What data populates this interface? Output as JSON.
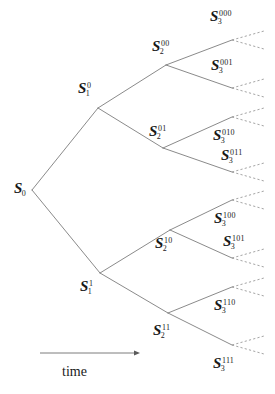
{
  "figure": {
    "type": "scenario-tree",
    "background_color": "#ffffff",
    "line_color": "#7d7d7d",
    "dash_color": "#9a9a9a",
    "text_color": "#1a1a1a"
  },
  "axis": {
    "caption": "time",
    "arrow_from_x": 40,
    "arrow_to_x": 140,
    "arrow_y": 353,
    "caption_x": 62,
    "caption_y": 365
  },
  "nodes": [
    {
      "id": "S0",
      "base": "S",
      "sub": "0",
      "sup": "",
      "x": 32,
      "y": 190,
      "label_x": 14,
      "label_y": 181,
      "stage": 0
    },
    {
      "id": "S1_0",
      "base": "S",
      "sub": "1",
      "sup": "0",
      "x": 98,
      "y": 108,
      "label_x": 78,
      "label_y": 81,
      "stage": 1
    },
    {
      "id": "S1_1",
      "base": "S",
      "sub": "1",
      "sup": "1",
      "x": 100,
      "y": 273,
      "label_x": 80,
      "label_y": 279,
      "stage": 1
    },
    {
      "id": "S2_00",
      "base": "S",
      "sub": "2",
      "sup": "00",
      "x": 166,
      "y": 65,
      "label_x": 152,
      "label_y": 39,
      "stage": 2
    },
    {
      "id": "S2_01",
      "base": "S",
      "sub": "2",
      "sup": "01",
      "x": 163,
      "y": 148,
      "label_x": 149,
      "label_y": 124,
      "stage": 2
    },
    {
      "id": "S2_10",
      "base": "S",
      "sub": "2",
      "sup": "10",
      "x": 170,
      "y": 230,
      "label_x": 155,
      "label_y": 236,
      "stage": 2
    },
    {
      "id": "S2_11",
      "base": "S",
      "sub": "2",
      "sup": "11",
      "x": 168,
      "y": 313,
      "label_x": 153,
      "label_y": 323,
      "stage": 2
    },
    {
      "id": "S3_000",
      "base": "S",
      "sub": "3",
      "sup": "000",
      "x": 232,
      "y": 40,
      "label_x": 210,
      "label_y": 9,
      "stage": 3
    },
    {
      "id": "S3_001",
      "base": "S",
      "sub": "3",
      "sup": "001",
      "x": 232,
      "y": 88,
      "label_x": 211,
      "label_y": 58,
      "stage": 3
    },
    {
      "id": "S3_010",
      "base": "S",
      "sub": "3",
      "sup": "010",
      "x": 232,
      "y": 117,
      "label_x": 213,
      "label_y": 128,
      "stage": 3
    },
    {
      "id": "S3_011",
      "base": "S",
      "sub": "3",
      "sup": "011",
      "x": 232,
      "y": 172,
      "label_x": 221,
      "label_y": 148,
      "stage": 3
    },
    {
      "id": "S3_100",
      "base": "S",
      "sub": "3",
      "sup": "100",
      "x": 232,
      "y": 200,
      "label_x": 214,
      "label_y": 211,
      "stage": 3
    },
    {
      "id": "S3_101",
      "base": "S",
      "sub": "3",
      "sup": "101",
      "x": 232,
      "y": 258,
      "label_x": 223,
      "label_y": 234,
      "stage": 3
    },
    {
      "id": "S3_110",
      "base": "S",
      "sub": "3",
      "sup": "110",
      "x": 232,
      "y": 287,
      "label_x": 214,
      "label_y": 298,
      "stage": 3
    },
    {
      "id": "S3_111",
      "base": "S",
      "sub": "3",
      "sup": "111",
      "x": 232,
      "y": 345,
      "label_x": 213,
      "label_y": 356,
      "stage": 3
    }
  ],
  "edges": [
    {
      "from": "S0",
      "to": "S1_0"
    },
    {
      "from": "S0",
      "to": "S1_1"
    },
    {
      "from": "S1_0",
      "to": "S2_00"
    },
    {
      "from": "S1_0",
      "to": "S2_01"
    },
    {
      "from": "S1_1",
      "to": "S2_10"
    },
    {
      "from": "S1_1",
      "to": "S2_11"
    },
    {
      "from": "S2_00",
      "to": "S3_000"
    },
    {
      "from": "S2_00",
      "to": "S3_001"
    },
    {
      "from": "S2_01",
      "to": "S3_010"
    },
    {
      "from": "S2_01",
      "to": "S3_011"
    },
    {
      "from": "S2_10",
      "to": "S3_100"
    },
    {
      "from": "S2_10",
      "to": "S3_101"
    },
    {
      "from": "S2_11",
      "to": "S3_110"
    },
    {
      "from": "S2_11",
      "to": "S3_111"
    }
  ],
  "continuations": [
    {
      "from": "S3_000",
      "dx": 32,
      "dy": -9
    },
    {
      "from": "S3_000",
      "dx": 32,
      "dy": 9
    },
    {
      "from": "S3_001",
      "dx": 32,
      "dy": -9
    },
    {
      "from": "S3_001",
      "dx": 32,
      "dy": 9
    },
    {
      "from": "S3_010",
      "dx": 32,
      "dy": -9
    },
    {
      "from": "S3_010",
      "dx": 32,
      "dy": 9
    },
    {
      "from": "S3_011",
      "dx": 32,
      "dy": -9
    },
    {
      "from": "S3_011",
      "dx": 32,
      "dy": 9
    },
    {
      "from": "S3_100",
      "dx": 32,
      "dy": -9
    },
    {
      "from": "S3_100",
      "dx": 32,
      "dy": 9
    },
    {
      "from": "S3_101",
      "dx": 32,
      "dy": -9
    },
    {
      "from": "S3_101",
      "dx": 32,
      "dy": 9
    },
    {
      "from": "S3_110",
      "dx": 32,
      "dy": -9
    },
    {
      "from": "S3_110",
      "dx": 32,
      "dy": 9
    },
    {
      "from": "S3_111",
      "dx": 32,
      "dy": -9
    },
    {
      "from": "S3_111",
      "dx": 32,
      "dy": 9
    }
  ]
}
